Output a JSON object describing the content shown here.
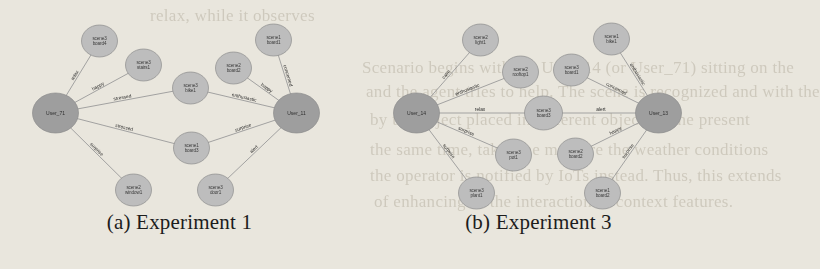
{
  "figure": {
    "panels": [
      {
        "id": "experiment-1",
        "caption": "(a) Experiment 1",
        "users": [
          {
            "id": "u-left",
            "label": "User_71",
            "cx": 36,
            "cy": 113,
            "rx": 23,
            "ry": 20
          },
          {
            "id": "u-right",
            "label": "User_11",
            "cx": 277,
            "cy": 113,
            "rx": 23,
            "ry": 20
          }
        ],
        "objects": [
          {
            "id": "o1",
            "label_line1": "scene3",
            "label_line2": "board4",
            "cx": 80,
            "cy": 41,
            "rx": 18,
            "ry": 16
          },
          {
            "id": "o2",
            "label_line1": "scene3",
            "label_line2": "stairs1",
            "cx": 124,
            "cy": 65,
            "rx": 18,
            "ry": 16
          },
          {
            "id": "o3",
            "label_line1": "scene3",
            "label_line2": "bike1",
            "cx": 171,
            "cy": 88,
            "rx": 18,
            "ry": 16
          },
          {
            "id": "o4",
            "label_line1": "scene2",
            "label_line2": "board2",
            "cx": 214,
            "cy": 68,
            "rx": 18,
            "ry": 16
          },
          {
            "id": "o5",
            "label_line1": "scene1",
            "label_line2": "board1",
            "cx": 254,
            "cy": 40,
            "rx": 18,
            "ry": 16
          },
          {
            "id": "o6",
            "label_line1": "scene1",
            "label_line2": "board3",
            "cx": 172,
            "cy": 148,
            "rx": 18,
            "ry": 16
          },
          {
            "id": "o7",
            "label_line1": "scene2",
            "label_line2": "window1",
            "cx": 114,
            "cy": 190,
            "rx": 18,
            "ry": 16
          },
          {
            "id": "o8",
            "label_line1": "scene3",
            "label_line2": "door1",
            "cx": 196,
            "cy": 190,
            "rx": 18,
            "ry": 16
          }
        ],
        "edges": [
          {
            "from": "u-left",
            "to": "o1",
            "label": "relax"
          },
          {
            "from": "u-left",
            "to": "o2",
            "label": "happy"
          },
          {
            "from": "u-left",
            "to": "o3",
            "label": "stressed"
          },
          {
            "from": "u-left",
            "to": "o6",
            "label": "stressed"
          },
          {
            "from": "u-left",
            "to": "o7",
            "label": "surprise"
          },
          {
            "from": "o3",
            "to": "u-right",
            "label": "enthusiastic"
          },
          {
            "from": "o4",
            "to": "u-right",
            "label": "happy"
          },
          {
            "from": "o5",
            "to": "u-right",
            "label": "concerned"
          },
          {
            "from": "o6",
            "to": "u-right",
            "label": "surprise"
          },
          {
            "from": "o8",
            "to": "u-right",
            "label": "alert"
          }
        ]
      },
      {
        "id": "experiment-3",
        "caption": "(b) Experiment 3",
        "users": [
          {
            "id": "u-left",
            "label": "User_14",
            "cx": 48,
            "cy": 113,
            "rx": 23,
            "ry": 20
          },
          {
            "id": "u-right",
            "label": "User_13",
            "cx": 290,
            "cy": 113,
            "rx": 23,
            "ry": 20
          }
        ],
        "objects": [
          {
            "id": "o1",
            "label_line1": "scene2",
            "label_line2": "light1",
            "cx": 112,
            "cy": 40,
            "rx": 18,
            "ry": 16
          },
          {
            "id": "o2",
            "label_line1": "scene2",
            "label_line2": "rooftop1",
            "cx": 152,
            "cy": 72,
            "rx": 18,
            "ry": 16
          },
          {
            "id": "o3",
            "label_line1": "scene3",
            "label_line2": "board1",
            "cx": 203,
            "cy": 70,
            "rx": 18,
            "ry": 16
          },
          {
            "id": "o4",
            "label_line1": "scene1",
            "label_line2": "bike1",
            "cx": 243,
            "cy": 39,
            "rx": 18,
            "ry": 16
          },
          {
            "id": "o5",
            "label_line1": "scene3",
            "label_line2": "board3",
            "cx": 175,
            "cy": 113,
            "rx": 19,
            "ry": 17
          },
          {
            "id": "o6",
            "label_line1": "scene3",
            "label_line2": "pot1",
            "cx": 145,
            "cy": 155,
            "rx": 18,
            "ry": 16
          },
          {
            "id": "o7",
            "label_line1": "scene2",
            "label_line2": "board2",
            "cx": 207,
            "cy": 154,
            "rx": 18,
            "ry": 16
          },
          {
            "id": "o8",
            "label_line1": "scene3",
            "label_line2": "plant1",
            "cx": 108,
            "cy": 193,
            "rx": 18,
            "ry": 16
          },
          {
            "id": "o9",
            "label_line1": "scene1",
            "label_line2": "board2",
            "cx": 234,
            "cy": 193,
            "rx": 18,
            "ry": 16
          }
        ],
        "edges": [
          {
            "from": "u-left",
            "to": "o1",
            "label": "calm"
          },
          {
            "from": "u-left",
            "to": "o2",
            "label": "enthusiastic"
          },
          {
            "from": "u-left",
            "to": "o5",
            "label": "relax"
          },
          {
            "from": "u-left",
            "to": "o6",
            "label": "surprise"
          },
          {
            "from": "u-left",
            "to": "o8",
            "label": "surprise"
          },
          {
            "from": "o3",
            "to": "u-right",
            "label": "concerned"
          },
          {
            "from": "o4",
            "to": "u-right",
            "label": "enthusiastic"
          },
          {
            "from": "o5",
            "to": "u-right",
            "label": "alert"
          },
          {
            "from": "o7",
            "to": "u-right",
            "label": "happy"
          },
          {
            "from": "o9",
            "to": "u-right",
            "label": "surprise"
          }
        ]
      }
    ],
    "colors": {
      "page_background": "#e9e6dd",
      "user_node_fill": "#9e9e9e",
      "object_node_fill": "#bdbdbd",
      "edge_stroke": "#9a9a9a",
      "caption_text": "#1c1c1c"
    }
  },
  "background_text": {
    "lines": [
      {
        "text": "relax, while it observes",
        "x": 150,
        "y": 6
      },
      {
        "text": "Scenario begins with the User_14 (or User_71) sitting on the",
        "x": 362,
        "y": 58
      },
      {
        "text": "and the agent tries to help. The scene is recognized and with the",
        "x": 366,
        "y": 82
      },
      {
        "text": "by the object placed in different object. In the present",
        "x": 370,
        "y": 110
      },
      {
        "text": "the same time, takes the measure the weather conditions",
        "x": 370,
        "y": 140
      },
      {
        "text": "the operator is notified by IoTs instead. Thus, this extends",
        "x": 370,
        "y": 166
      },
      {
        "text": "of enhancing of the interaction of context features.",
        "x": 374,
        "y": 192
      }
    ]
  }
}
